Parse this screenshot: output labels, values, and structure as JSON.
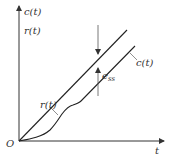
{
  "diagram": {
    "axes": {
      "y_label_top": "c(t)",
      "y_label_bottom": "r(t)",
      "x_label": "t",
      "origin_label": "O"
    },
    "curves": {
      "input": {
        "label": "r(t)",
        "description": "ramp input"
      },
      "output": {
        "label": "c(t)",
        "description": "system output"
      }
    },
    "error": {
      "label_main": "e",
      "label_sub": "ss",
      "description": "steady-state error between r(t) and c(t)"
    },
    "colors": {
      "line": "#222222",
      "axis": "#333333",
      "text": "#333333",
      "arrow": "#555555"
    }
  }
}
